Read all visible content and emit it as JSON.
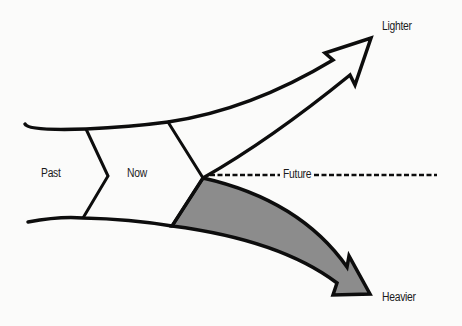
{
  "diagram": {
    "labels": {
      "past": "Past",
      "now": "Now",
      "future": "Future",
      "lighter": "Lighter",
      "heavier": "Heavier"
    },
    "colors": {
      "stroke": "#0d0d0d",
      "heavier_fill": "#8c8c8c",
      "background": "#fbfbfa"
    }
  }
}
